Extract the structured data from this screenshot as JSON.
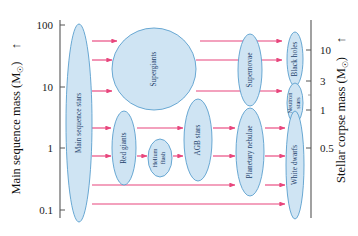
{
  "figure": {
    "type": "diagram",
    "background_color": "#ffffff",
    "blob_fill": "#cfe4f3",
    "blob_stroke": "#5a9fce",
    "arrow_color": "#e8457c",
    "axis_color": "#555555"
  },
  "left_axis": {
    "title": "Main sequence mass (M",
    "title_sub": "☉",
    "title_close": ")",
    "arrow_glyph": "↑",
    "ticks": [
      {
        "label": "100",
        "y": 25
      },
      {
        "label": "10",
        "y": 87
      },
      {
        "label": "1",
        "y": 148
      },
      {
        "label": "0.1",
        "y": 210
      }
    ]
  },
  "right_axis": {
    "title": "Stellar corpse mass (M",
    "title_sub": "☉",
    "title_close": ")",
    "arrow_glyph": "↑",
    "ticks": [
      {
        "label": "10",
        "y": 50
      },
      {
        "label": "3",
        "y": 81
      },
      {
        "label": "1",
        "y": 110
      },
      {
        "label": "0.5",
        "y": 148
      }
    ]
  },
  "stages": [
    {
      "id": "main-sequence-stars",
      "label": "Main sequence stars",
      "label_lines": [
        "Main sequence stars"
      ],
      "cx": 79,
      "cy": 123,
      "rx": 13,
      "ry": 99
    },
    {
      "id": "supergiants",
      "label": "Supergiants",
      "label_lines": [
        "Supergiants"
      ],
      "cx": 154,
      "cy": 69,
      "rx": 42,
      "ry": 41
    },
    {
      "id": "red-giants",
      "label": "Red giants",
      "label_lines": [
        "Red giants"
      ],
      "cx": 124,
      "cy": 148,
      "rx": 12,
      "ry": 37
    },
    {
      "id": "helium-flash",
      "label": "Helium flash",
      "label_lines": [
        "Helium",
        "flash"
      ],
      "cx": 160,
      "cy": 158,
      "rx": 12,
      "ry": 19
    },
    {
      "id": "agb-stars",
      "label": "AGB stars",
      "label_lines": [
        "AGB stars"
      ],
      "cx": 198,
      "cy": 140,
      "rx": 14,
      "ry": 41
    },
    {
      "id": "supernovae",
      "label": "Supernovae",
      "label_lines": [
        "Supernovae"
      ],
      "cx": 250,
      "cy": 70,
      "rx": 12,
      "ry": 36
    },
    {
      "id": "planetary-nebulae",
      "label": "Planetary nebulae",
      "label_lines": [
        "Planetary nebulae"
      ],
      "cx": 250,
      "cy": 152,
      "rx": 14,
      "ry": 44
    },
    {
      "id": "black-holes",
      "label": "Black holes",
      "label_lines": [
        "Black holes"
      ],
      "cx": 295,
      "cy": 59,
      "rx": 8,
      "ry": 27
    },
    {
      "id": "neutron-stars",
      "label": "Neutron stars",
      "label_lines": [
        "Neutron",
        "stars"
      ],
      "cx": 295,
      "cy": 103,
      "rx": 8,
      "ry": 20
    },
    {
      "id": "white-dwarfs",
      "label": "White dwarfs",
      "label_lines": [
        "White dwarfs"
      ],
      "cx": 295,
      "cy": 165,
      "rx": 9,
      "ry": 54
    }
  ],
  "arrow_rows": [
    {
      "id": "row-1",
      "y": 41,
      "segments": [
        [
          92,
          117
        ],
        [
          200,
          282
        ]
      ]
    },
    {
      "id": "row-2",
      "y": 60,
      "segments": [
        [
          92,
          112
        ],
        [
          196,
          282
        ]
      ]
    },
    {
      "id": "row-3",
      "y": 91,
      "segments": [
        [
          92,
          112
        ],
        [
          196,
          282
        ]
      ]
    },
    {
      "id": "row-4",
      "y": 128,
      "segments": [
        [
          92,
          111
        ],
        [
          137,
          183
        ],
        [
          213,
          235
        ],
        [
          265,
          285
        ]
      ]
    },
    {
      "id": "row-5",
      "y": 156,
      "segments": [
        [
          92,
          111
        ],
        [
          137,
          147
        ],
        [
          173,
          183
        ],
        [
          213,
          235
        ],
        [
          265,
          285
        ]
      ]
    },
    {
      "id": "row-6",
      "y": 185,
      "segments": [
        [
          92,
          235
        ],
        [
          265,
          285
        ]
      ]
    },
    {
      "id": "row-7",
      "y": 204,
      "segments": [
        [
          92,
          285
        ]
      ]
    }
  ],
  "plot_frame": {
    "left_axis_x": 60,
    "right_axis_x": 311,
    "top_y": 20,
    "bottom_y": 218
  }
}
